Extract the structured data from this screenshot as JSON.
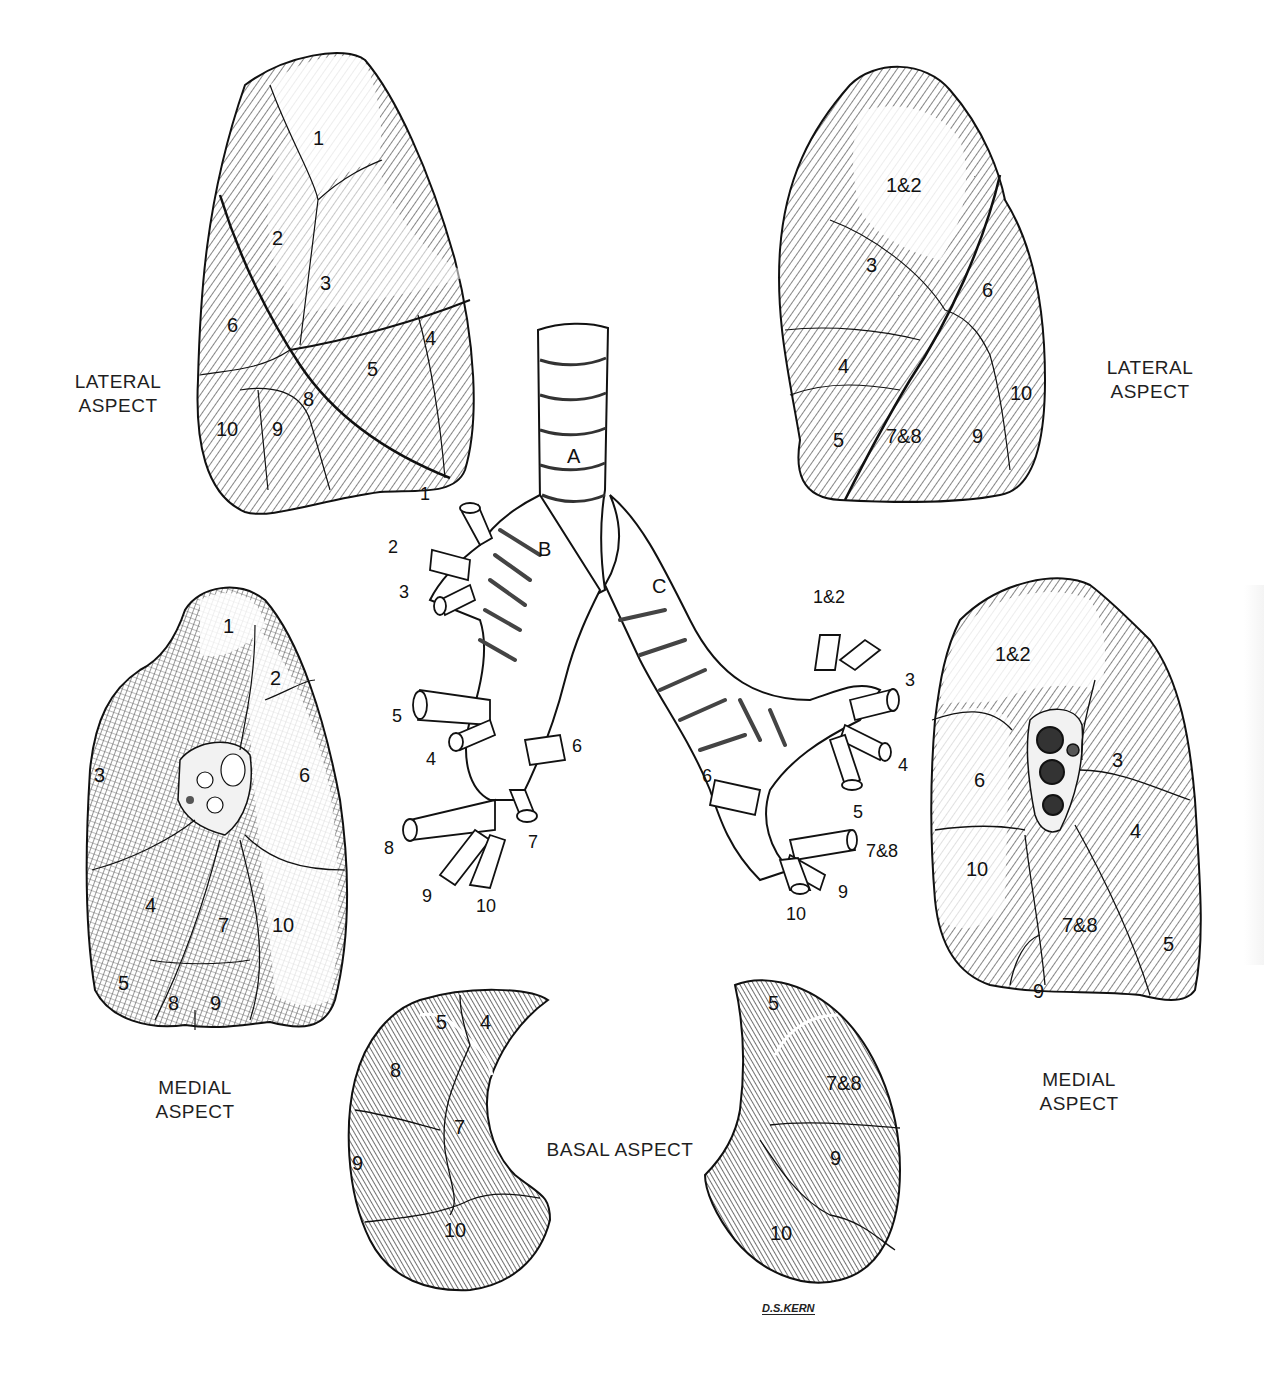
{
  "figure": {
    "artist_signature": "D.S.KERN",
    "colors": {
      "ink": "#111111",
      "paper": "#ffffff",
      "shade_dark": "#5a5a5a",
      "shade_mid": "#8c8c8c",
      "shade_light": "#c8c8c8"
    }
  },
  "panels": {
    "right_lung_lateral": {
      "caption_line1": "LATERAL",
      "caption_line2": "ASPECT",
      "segments": [
        "1",
        "2",
        "3",
        "4",
        "5",
        "6",
        "8",
        "9",
        "10"
      ]
    },
    "left_lung_lateral": {
      "caption_line1": "LATERAL",
      "caption_line2": "ASPECT",
      "segments": [
        "1&2",
        "3",
        "4",
        "5",
        "6",
        "7&8",
        "9",
        "10"
      ]
    },
    "right_lung_medial": {
      "caption_line1": "MEDIAL",
      "caption_line2": "ASPECT",
      "segments": [
        "1",
        "2",
        "3",
        "6",
        "4",
        "7",
        "10",
        "5",
        "8",
        "9"
      ]
    },
    "left_lung_medial": {
      "caption_line1": "MEDIAL",
      "caption_line2": "ASPECT",
      "segments": [
        "1&2",
        "3",
        "6",
        "4",
        "10",
        "7&8",
        "5",
        "9"
      ]
    },
    "basal": {
      "caption": "BASAL ASPECT",
      "right_segments": [
        "5",
        "4",
        "8",
        "7",
        "9",
        "10"
      ],
      "left_segments": [
        "5",
        "7&8",
        "9",
        "10"
      ]
    },
    "bronchial_tree": {
      "trachea_label": "A",
      "right_main_bronchus_label": "B",
      "left_main_bronchus_label": "C",
      "right_branches": [
        "1",
        "2",
        "3",
        "5",
        "4",
        "6",
        "8",
        "7",
        "9",
        "10"
      ],
      "left_branches": [
        "1&2",
        "3",
        "4",
        "6",
        "5",
        "7&8",
        "9",
        "10"
      ]
    }
  }
}
